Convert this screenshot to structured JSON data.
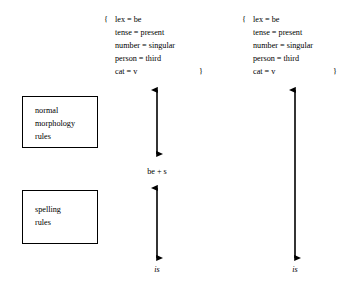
{
  "diagram": {
    "background_color": "#ffffff",
    "ink_color": "#000000"
  },
  "feature_structures": [
    {
      "id": "left",
      "brace_open": "{",
      "brace_close": "}",
      "attributes": [
        {
          "name": "lex",
          "operator": "=",
          "value": "be",
          "text": "lex = be"
        },
        {
          "name": "tense",
          "operator": "=",
          "value": "present",
          "text": "tense = present"
        },
        {
          "name": "number",
          "operator": "=",
          "value": "singular",
          "text": "number = singular"
        },
        {
          "name": "person",
          "operator": "=",
          "value": "third",
          "text": "person = third"
        },
        {
          "name": "cat",
          "operator": "=",
          "value": "v",
          "text": "cat = v"
        }
      ]
    },
    {
      "id": "right",
      "brace_open": "{",
      "brace_close": "}",
      "attributes": [
        {
          "name": "lex",
          "operator": "=",
          "value": "be",
          "text": "lex = be"
        },
        {
          "name": "tense",
          "operator": "=",
          "value": "present",
          "text": "tense = present"
        },
        {
          "name": "number",
          "operator": "=",
          "value": "singular",
          "text": "number = singular"
        },
        {
          "name": "person",
          "operator": "=",
          "value": "third",
          "text": "person = third"
        },
        {
          "name": "cat",
          "operator": "=",
          "value": "v",
          "text": "cat = v"
        }
      ]
    }
  ],
  "rule_boxes": [
    {
      "id": "morphology",
      "lines": [
        "normal",
        "morphology",
        "rules"
      ]
    },
    {
      "id": "spelling",
      "lines": [
        "spelling",
        "rules"
      ]
    }
  ],
  "arrows": [
    {
      "id": "middle-upper",
      "style": "double-headed-vertical"
    },
    {
      "id": "middle-lower",
      "style": "double-headed-vertical"
    },
    {
      "id": "right-full",
      "style": "double-headed-vertical"
    }
  ],
  "labels": {
    "intermediate_form": "be + s",
    "surface_form_middle": "is",
    "surface_form_right": "is"
  }
}
